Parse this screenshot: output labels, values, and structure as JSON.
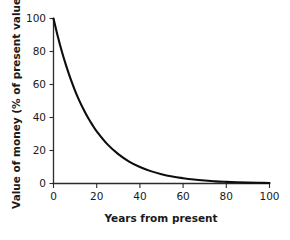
{
  "chart_data": {
    "type": "line",
    "title": "",
    "xlabel": "Years from present",
    "ylabel": "Value of money (% of present value)",
    "xlim": [
      0,
      100
    ],
    "ylim": [
      0,
      100
    ],
    "xticks": [
      0,
      20,
      40,
      60,
      80,
      100
    ],
    "yticks": [
      0,
      20,
      40,
      60,
      80,
      100
    ],
    "xtick_labels": [
      "0",
      "20",
      "40",
      "60",
      "80",
      "100"
    ],
    "ytick_labels": [
      "0",
      "20",
      "40",
      "60",
      "80",
      "100"
    ],
    "grid": false,
    "legend": false,
    "legend_position": "none",
    "series": [
      {
        "name": "Discounted value of money",
        "color": "#0d0d0d",
        "x": [
          0,
          2,
          4,
          6,
          8,
          10,
          12,
          14,
          16,
          18,
          20,
          25,
          30,
          35,
          40,
          45,
          50,
          55,
          60,
          65,
          70,
          75,
          80,
          85,
          90,
          95,
          100
        ],
        "y": [
          100.0,
          89.1,
          79.4,
          70.8,
          63.1,
          56.2,
          50.1,
          44.7,
          39.8,
          35.5,
          31.6,
          23.7,
          17.8,
          13.3,
          10.0,
          7.5,
          5.6,
          4.2,
          3.2,
          2.4,
          1.8,
          1.3,
          1.0,
          0.75,
          0.56,
          0.42,
          0.32
        ]
      }
    ]
  },
  "figure": {
    "background_color": "#ffffff",
    "axis_color": "#2b2b2b",
    "text_color": "#1a1a1a"
  }
}
